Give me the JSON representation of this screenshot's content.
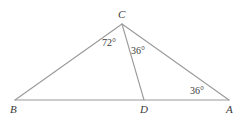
{
  "figure": {
    "kind": "geometry-diagram",
    "stroke_color": "#9a9a9a",
    "text_color": "#3a3a3a",
    "background_color": "#ffffff",
    "width": 243,
    "height": 119
  },
  "points": {
    "B": {
      "label": "B",
      "x": 15,
      "y": 100,
      "label_x": 10,
      "label_y": 104
    },
    "C": {
      "label": "C",
      "x": 122,
      "y": 24,
      "label_x": 118,
      "label_y": 9
    },
    "D": {
      "label": "D",
      "x": 144,
      "y": 100,
      "label_x": 140,
      "label_y": 104
    },
    "A": {
      "label": "A",
      "x": 229,
      "y": 100,
      "label_x": 226,
      "label_y": 104
    }
  },
  "segments": [
    {
      "name": "BA",
      "from": "B",
      "to": "A"
    },
    {
      "name": "BC",
      "from": "B",
      "to": "C"
    },
    {
      "name": "CA",
      "from": "C",
      "to": "A"
    },
    {
      "name": "CD",
      "from": "C",
      "to": "D"
    }
  ],
  "angles": [
    {
      "name": "angle-BCD",
      "value": "72°",
      "at": "C",
      "label_x": 102,
      "label_y": 38
    },
    {
      "name": "angle-DCA",
      "value": "36°",
      "at": "C",
      "label_x": 131,
      "label_y": 46
    },
    {
      "name": "angle-CAD",
      "value": "36°",
      "at": "A",
      "label_x": 190,
      "label_y": 86
    }
  ]
}
